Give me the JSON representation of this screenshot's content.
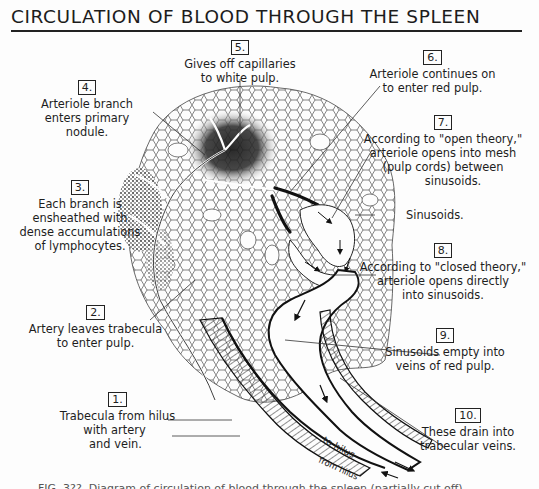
{
  "title": "CIRCULATION OF BLOOD THROUGH THE SPLEEN",
  "labels": [
    {
      "num": "1.",
      "lines": [
        "Trabecula from hilus",
        "with artery",
        "and vein."
      ]
    },
    {
      "num": "2.",
      "lines": [
        "Artery leaves trabecula",
        "to enter pulp."
      ]
    },
    {
      "num": "3.",
      "lines": [
        "Each branch is",
        "ensheathed with",
        "dense accumulations",
        "of lymphocytes."
      ]
    },
    {
      "num": "4.",
      "lines": [
        "Arteriole branch",
        "enters primary",
        "nodule."
      ]
    },
    {
      "num": "5.",
      "lines": [
        "Gives off capillaries",
        "to white pulp."
      ]
    },
    {
      "num": "6.",
      "lines": [
        "Arteriole continues on",
        "to enter red pulp."
      ]
    },
    {
      "num": "7.",
      "lines": [
        "According to \"open theory,\"",
        "arteriole opens into mesh",
        "(pulp cords) between",
        "sinusoids."
      ]
    },
    {
      "num": "",
      "lines": [
        "Sinusoids."
      ]
    },
    {
      "num": "8.",
      "lines": [
        "According to \"closed theory,\"",
        "arteriole opens directly",
        "into sinusoids."
      ]
    },
    {
      "num": "9.",
      "lines": [
        "Sinusoids empty into",
        "veins of red pulp."
      ]
    },
    {
      "num": "10.",
      "lines": [
        "These drain into",
        "trabecular veins."
      ]
    }
  ],
  "vessel_annotations": {
    "to_hilus": "to hilus",
    "from_hilus": "from hilus"
  },
  "caption": "FIG. 3??. Diagram of circulation of blood through the spleen (partially cut off)",
  "colors": {
    "ink": "#1a1a1a",
    "paper": "#fdfdfd"
  }
}
